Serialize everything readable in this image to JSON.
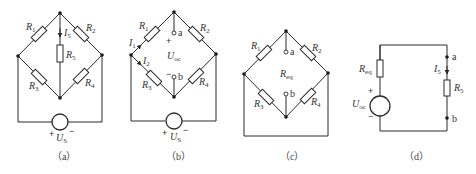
{
  "figures": [
    {
      "id": "a",
      "caption": "（a）",
      "labels": {
        "R1": {
          "main": "R",
          "sub": "1"
        },
        "R2": {
          "main": "R",
          "sub": "2"
        },
        "R3": {
          "main": "R",
          "sub": "3"
        },
        "R4": {
          "main": "R",
          "sub": "4"
        },
        "R5": {
          "main": "R",
          "sub": "5"
        },
        "I5": {
          "main": "I",
          "sub": "5"
        },
        "US": {
          "main": "U",
          "sub": "S"
        },
        "plus": "+",
        "minus": "−"
      }
    },
    {
      "id": "b",
      "caption": "（b）",
      "labels": {
        "R1": {
          "main": "R",
          "sub": "1"
        },
        "R2": {
          "main": "R",
          "sub": "2"
        },
        "R3": {
          "main": "R",
          "sub": "3"
        },
        "R4": {
          "main": "R",
          "sub": "4"
        },
        "I1": {
          "main": "I",
          "sub": "1"
        },
        "I2": {
          "main": "I",
          "sub": "2"
        },
        "Uoc": {
          "main": "U",
          "sub": "oc"
        },
        "US": {
          "main": "U",
          "sub": "S"
        },
        "a": "a",
        "b": "b",
        "plus": "+",
        "minus": "−"
      }
    },
    {
      "id": "c",
      "caption": "（c）",
      "labels": {
        "R1": {
          "main": "R",
          "sub": "1"
        },
        "R2": {
          "main": "R",
          "sub": "2"
        },
        "R3": {
          "main": "R",
          "sub": "3"
        },
        "R4": {
          "main": "R",
          "sub": "4"
        },
        "Req": {
          "main": "R",
          "sub": "eq"
        },
        "a": "a",
        "b": "b"
      }
    },
    {
      "id": "d",
      "caption": "（d）",
      "labels": {
        "Req": {
          "main": "R",
          "sub": "eq"
        },
        "Uoc": {
          "main": "U",
          "sub": "oc"
        },
        "I5": {
          "main": "I",
          "sub": "5"
        },
        "R5": {
          "main": "R",
          "sub": "5"
        },
        "a": "a",
        "b": "b",
        "plus": "+",
        "minus": "−"
      }
    }
  ]
}
